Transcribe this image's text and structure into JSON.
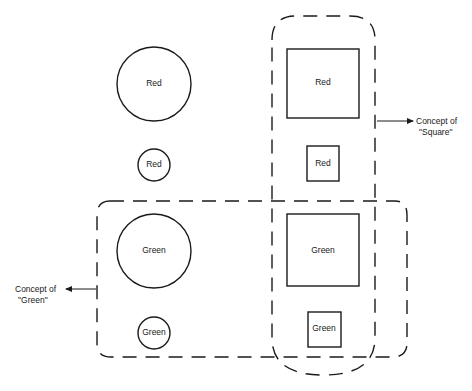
{
  "diagram": {
    "shapes": [
      {
        "id": "large-red-circle",
        "type": "circle",
        "size": "large",
        "label": "Red"
      },
      {
        "id": "small-red-circle",
        "type": "circle",
        "size": "small",
        "label": "Red"
      },
      {
        "id": "large-red-square",
        "type": "square",
        "size": "large",
        "label": "Red"
      },
      {
        "id": "small-red-square",
        "type": "square",
        "size": "small",
        "label": "Red"
      },
      {
        "id": "large-green-circle",
        "type": "circle",
        "size": "large",
        "label": "Green"
      },
      {
        "id": "small-green-circle",
        "type": "circle",
        "size": "small",
        "label": "Green"
      },
      {
        "id": "large-green-square",
        "type": "square",
        "size": "large",
        "label": "Green"
      },
      {
        "id": "small-green-square",
        "type": "square",
        "size": "small",
        "label": "Green"
      }
    ],
    "concepts": {
      "square": {
        "line1": "Concept of",
        "line2": "\"Square\""
      },
      "green": {
        "line1": "Concept of",
        "line2": "\"Green\""
      }
    },
    "colors": {
      "stroke": "#1a1a1a",
      "background": "#ffffff"
    }
  }
}
